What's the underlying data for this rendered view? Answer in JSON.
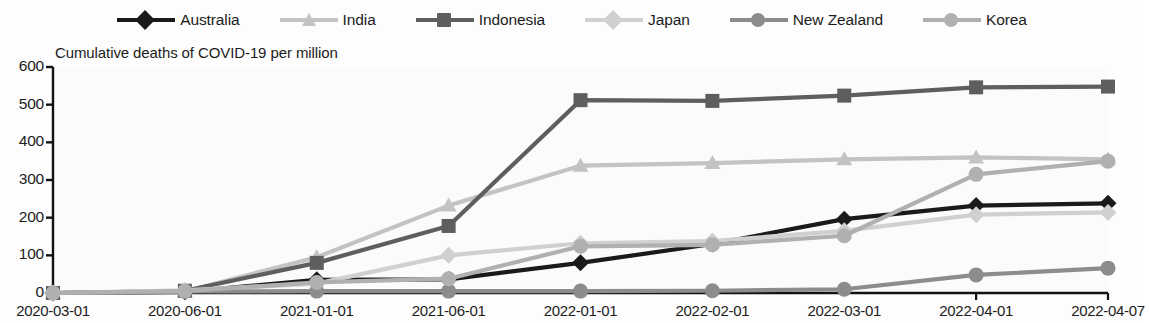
{
  "chart_data": {
    "type": "line",
    "title": "Cumulative deaths of COVID-19 per million",
    "xlabel": "",
    "ylabel": "",
    "ylim": [
      0,
      600
    ],
    "yticks": [
      0,
      100,
      200,
      300,
      400,
      500,
      600
    ],
    "grid": false,
    "legend_position": "top",
    "categories": [
      "2020-03-01",
      "2020-06-01",
      "2021-01-01",
      "2021-06-01",
      "2022-01-01",
      "2022-02-01",
      "2022-03-01",
      "2022-04-01",
      "2022-04-07"
    ],
    "series": [
      {
        "name": "Australia",
        "color": "#1a1a1a",
        "marker": "diamond",
        "values": [
          0,
          3,
          35,
          36,
          80,
          130,
          196,
          232,
          238
        ]
      },
      {
        "name": "India",
        "color": "#c3c3c3",
        "marker": "triangle",
        "values": [
          0,
          4,
          95,
          232,
          338,
          345,
          355,
          360,
          355
        ]
      },
      {
        "name": "Indonesia",
        "color": "#5e5e5e",
        "marker": "square",
        "values": [
          0,
          6,
          80,
          178,
          512,
          510,
          524,
          546,
          548
        ]
      },
      {
        "name": "Japan",
        "color": "#d0d0d0",
        "marker": "diamond",
        "values": [
          0,
          7,
          25,
          100,
          132,
          138,
          165,
          208,
          214
        ]
      },
      {
        "name": "New Zealand",
        "color": "#8c8c8c",
        "marker": "circle",
        "values": [
          0,
          4,
          5,
          5,
          5,
          6,
          10,
          48,
          66
        ]
      },
      {
        "name": "Korea",
        "color": "#b0b0b0",
        "marker": "circle",
        "values": [
          0,
          5,
          28,
          38,
          124,
          128,
          152,
          315,
          350
        ]
      }
    ]
  },
  "legend": {
    "items": [
      {
        "label": "Australia"
      },
      {
        "label": "India"
      },
      {
        "label": "Indonesia"
      },
      {
        "label": "Japan"
      },
      {
        "label": "New Zealand"
      },
      {
        "label": "Korea"
      }
    ]
  },
  "axes": {
    "y_tick_labels": [
      "600",
      "500",
      "400",
      "300",
      "200",
      "100",
      "0"
    ],
    "x_tick_labels": [
      "2020-03-01",
      "2020-06-01",
      "2021-01-01",
      "2021-06-01",
      "2022-01-01",
      "2022-02-01",
      "2022-03-01",
      "2022-04-01",
      "2022-04-07"
    ]
  }
}
